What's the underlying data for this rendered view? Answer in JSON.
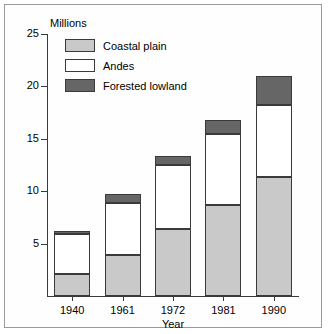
{
  "chart_data": {
    "type": "bar",
    "subtype": "stacked",
    "title": "",
    "xlabel": "Year",
    "ylabel": "Millions",
    "categories": [
      "1940",
      "1961",
      "1972",
      "1981",
      "1990"
    ],
    "series": [
      {
        "name": "Coastal plain",
        "color": "#c9c9c9",
        "values": [
          2.1,
          3.9,
          6.4,
          8.7,
          11.4
        ]
      },
      {
        "name": "Andes",
        "color": "#ffffff",
        "values": [
          3.8,
          5.0,
          6.1,
          6.8,
          6.8
        ]
      },
      {
        "name": "Forested lowland",
        "color": "#666666",
        "values": [
          0.3,
          0.8,
          0.9,
          1.3,
          2.8
        ]
      }
    ],
    "totals": [
      6.2,
      9.7,
      13.4,
      16.8,
      21.0
    ],
    "ylim": [
      0,
      25
    ],
    "yticks": [
      5,
      10,
      15,
      20,
      25
    ],
    "ytick_labels": [
      "5",
      "10",
      "15",
      "20",
      "25"
    ],
    "grid": false,
    "legend_position": "top-left",
    "axis_color": "#3a3a3a"
  },
  "axis": {
    "unit_label": "Millions",
    "x_title": "Year"
  }
}
